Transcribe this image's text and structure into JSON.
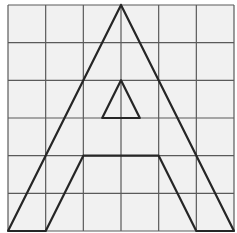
{
  "diagram": {
    "grid": {
      "rows": 6,
      "cols": 6,
      "background_color": "#f1f1f1",
      "line_color": "#5a5a5a"
    },
    "shape_color": "#262626",
    "outer_outline": [
      [
        3,
        0
      ],
      [
        6,
        6
      ],
      [
        5,
        6
      ],
      [
        4,
        4
      ],
      [
        2,
        4
      ],
      [
        1,
        6
      ],
      [
        0,
        6
      ],
      [
        3,
        0
      ]
    ],
    "inner_triangle": [
      [
        3,
        2
      ],
      [
        3.5,
        3
      ],
      [
        2.5,
        3
      ],
      [
        3,
        2
      ]
    ]
  }
}
